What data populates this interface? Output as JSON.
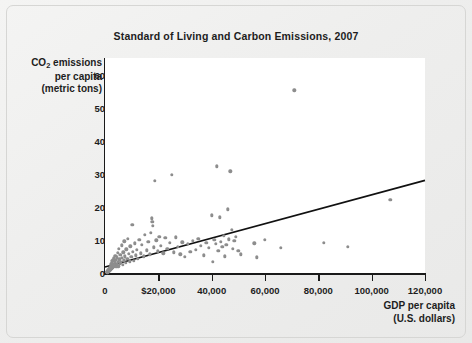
{
  "chart_data": {
    "type": "scatter",
    "title": "Standard of Living and Carbon Emissions, 2007",
    "xlabel": "GDP per capita\n(U.S. dollars)",
    "xlabel_line1": "GDP per capita",
    "xlabel_line2": "(U.S. dollars)",
    "ylabel_line1": "CO2 emissions",
    "ylabel_line2": "per capita",
    "ylabel_line3": "(metric tons)",
    "ylabel_prefix": "CO",
    "ylabel_sub": "2",
    "ylabel_suffix": " emissions",
    "grid": false,
    "legend": "none",
    "xlim": [
      0,
      120000
    ],
    "ylim": [
      0,
      65
    ],
    "xticks": [
      0,
      20000,
      40000,
      60000,
      80000,
      100000,
      120000
    ],
    "xtick_labels": [
      "0",
      "$20,000",
      "40,000",
      "60,000",
      "80,000",
      "100,000",
      "120,000"
    ],
    "yticks": [
      0,
      10,
      20,
      30,
      40,
      50,
      60
    ],
    "ytick_labels": [
      "0",
      "10",
      "20",
      "30",
      "40",
      "50",
      "60"
    ],
    "point_color": "#8d8d8d",
    "line_color": "#111111",
    "plot_background": "#ffffff",
    "page_background": "#eeeeed",
    "trendline": {
      "type": "linear",
      "x0": 0,
      "y0": 1.8,
      "x1": 120000,
      "y1": 28.0
    },
    "points": [
      [
        700,
        0.3
      ],
      [
        800,
        0.2
      ],
      [
        900,
        0.4
      ],
      [
        1000,
        0.3
      ],
      [
        1100,
        0.6
      ],
      [
        1200,
        0.5
      ],
      [
        1300,
        0.9
      ],
      [
        1400,
        0.4
      ],
      [
        1500,
        1.1
      ],
      [
        1600,
        0.7
      ],
      [
        1700,
        1.4
      ],
      [
        1800,
        0.8
      ],
      [
        1900,
        1.6
      ],
      [
        2000,
        1.0
      ],
      [
        2100,
        2.2
      ],
      [
        2200,
        1.3
      ],
      [
        2300,
        2.6
      ],
      [
        2400,
        1.7
      ],
      [
        2500,
        3.1
      ],
      [
        2600,
        1.2
      ],
      [
        2700,
        2.0
      ],
      [
        2800,
        3.6
      ],
      [
        2900,
        1.5
      ],
      [
        3000,
        2.4
      ],
      [
        3100,
        4.0
      ],
      [
        3200,
        1.9
      ],
      [
        3300,
        2.8
      ],
      [
        3400,
        4.4
      ],
      [
        3500,
        2.1
      ],
      [
        3600,
        3.3
      ],
      [
        3800,
        5.2
      ],
      [
        3900,
        2.3
      ],
      [
        4000,
        3.9
      ],
      [
        4200,
        1.8
      ],
      [
        4400,
        4.8
      ],
      [
        4500,
        2.7
      ],
      [
        4700,
        6.1
      ],
      [
        4800,
        3.4
      ],
      [
        5000,
        2.0
      ],
      [
        5200,
        7.3
      ],
      [
        5400,
        4.1
      ],
      [
        5600,
        2.9
      ],
      [
        5800,
        5.5
      ],
      [
        6000,
        3.2
      ],
      [
        6200,
        8.4
      ],
      [
        6400,
        4.6
      ],
      [
        6600,
        2.5
      ],
      [
        6800,
        6.3
      ],
      [
        7000,
        3.8
      ],
      [
        7200,
        9.6
      ],
      [
        7500,
        5.0
      ],
      [
        7800,
        3.0
      ],
      [
        8000,
        7.2
      ],
      [
        8300,
        4.3
      ],
      [
        8600,
        10.3
      ],
      [
        8900,
        5.8
      ],
      [
        9200,
        3.5
      ],
      [
        9500,
        8.1
      ],
      [
        9800,
        4.9
      ],
      [
        10200,
        14.6
      ],
      [
        10500,
        6.4
      ],
      [
        10800,
        3.7
      ],
      [
        11200,
        9.0
      ],
      [
        11600,
        5.3
      ],
      [
        12000,
        7.0
      ],
      [
        12400,
        4.2
      ],
      [
        12900,
        10.1
      ],
      [
        13400,
        6.0
      ],
      [
        13900,
        8.6
      ],
      [
        14500,
        5.1
      ],
      [
        15000,
        11.5
      ],
      [
        15600,
        6.9
      ],
      [
        16200,
        9.4
      ],
      [
        16800,
        5.6
      ],
      [
        17200,
        12.2
      ],
      [
        17600,
        16.5
      ],
      [
        17800,
        15.4
      ],
      [
        18000,
        14.2
      ],
      [
        18300,
        7.8
      ],
      [
        18700,
        27.9
      ],
      [
        19200,
        9.9
      ],
      [
        19800,
        6.6
      ],
      [
        20400,
        11.0
      ],
      [
        21000,
        8.2
      ],
      [
        21800,
        5.9
      ],
      [
        22600,
        10.6
      ],
      [
        23400,
        7.4
      ],
      [
        24200,
        9.1
      ],
      [
        25000,
        29.6
      ],
      [
        25800,
        6.2
      ],
      [
        26600,
        10.8
      ],
      [
        27400,
        8.0
      ],
      [
        28200,
        5.7
      ],
      [
        29000,
        9.3
      ],
      [
        30000,
        4.9
      ],
      [
        31000,
        8.8
      ],
      [
        32000,
        6.5
      ],
      [
        33000,
        9.8
      ],
      [
        34000,
        7.1
      ],
      [
        35000,
        10.4
      ],
      [
        36000,
        8.3
      ],
      [
        37000,
        5.4
      ],
      [
        38000,
        9.2
      ],
      [
        39000,
        7.6
      ],
      [
        40000,
        17.5
      ],
      [
        40500,
        3.3
      ],
      [
        41000,
        10.0
      ],
      [
        41500,
        8.9
      ],
      [
        42000,
        32.2
      ],
      [
        42500,
        6.7
      ],
      [
        43000,
        16.8
      ],
      [
        43500,
        9.5
      ],
      [
        44000,
        7.9
      ],
      [
        44500,
        11.3
      ],
      [
        45000,
        5.0
      ],
      [
        45500,
        8.5
      ],
      [
        46000,
        19.2
      ],
      [
        46500,
        10.2
      ],
      [
        47000,
        30.7
      ],
      [
        47500,
        13.0
      ],
      [
        48000,
        7.3
      ],
      [
        48500,
        9.7
      ],
      [
        49000,
        10.9
      ],
      [
        50000,
        6.8
      ],
      [
        51000,
        5.6
      ],
      [
        56000,
        9.0
      ],
      [
        57000,
        4.8
      ],
      [
        60000,
        10.1
      ],
      [
        66000,
        7.7
      ],
      [
        71000,
        55.2
      ],
      [
        82000,
        9.1
      ],
      [
        91000,
        8.0
      ],
      [
        107000,
        22.1
      ]
    ]
  }
}
